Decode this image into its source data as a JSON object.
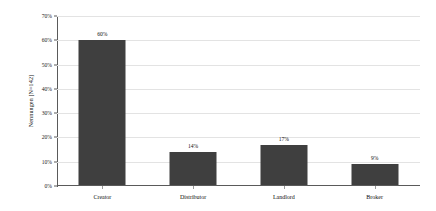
{
  "chart_data": {
    "type": "bar",
    "title": "",
    "subtitle": "",
    "xlabel": "",
    "ylabel": "Nennungen [N=142]",
    "categories": [
      "Creator",
      "Distributor",
      "Landlord",
      "Broker"
    ],
    "values": [
      60,
      14,
      17,
      9
    ],
    "value_labels": [
      "60%",
      "14%",
      "17%",
      "9%"
    ],
    "ylim": [
      0,
      70
    ],
    "ytick_values": [
      0,
      10,
      20,
      30,
      40,
      50,
      60,
      70
    ],
    "ytick_labels": [
      "0%",
      "10%",
      "20%",
      "30%",
      "40%",
      "50%",
      "60%",
      "70%"
    ],
    "grid": true,
    "legend": false,
    "legend_position": "none",
    "bar_color": "#3f3f3f",
    "grid_color": "#e3e3e3",
    "axis_color": "#5a5a5a",
    "background_color": "#ffffff"
  }
}
